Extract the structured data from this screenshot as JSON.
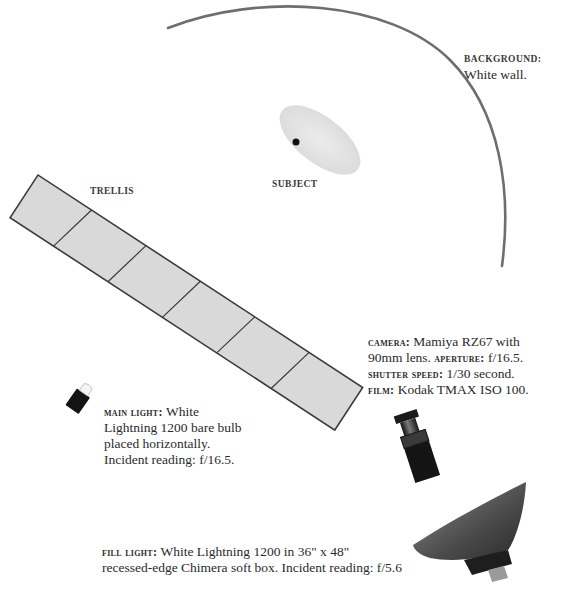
{
  "diagram": {
    "type": "lighting-diagram",
    "colors": {
      "background": "#ffffff",
      "wall_arc": "#6e6e6e",
      "trellis_fill": "#d9d9d9",
      "trellis_stroke": "#3a3a3a",
      "subject_fill": "#e6e6e6",
      "equipment_dark": "#1a1a1a",
      "softbox": "#5a5a5a",
      "text": "#2b2b2b"
    }
  },
  "labels": {
    "trellis": "TRELLIS",
    "subject": "SUBJECT",
    "background": {
      "title": "BACKGROUND:",
      "text": "White wall."
    },
    "camera": {
      "camera_label": "CAMERA:",
      "camera_value": "Mamiya RZ67 with",
      "camera_value2": "90mm lens.",
      "aperture_label": "APERTURE:",
      "aperture_value": "f/16.5.",
      "shutter_label": "SHUTTER SPEED:",
      "shutter_value": "1/30 second.",
      "film_label": "FILM:",
      "film_value": "Kodak TMAX ISO 100."
    },
    "main_light": {
      "title": "MAIN LIGHT:",
      "line1": "White",
      "line2": "Lightning 1200 bare bulb",
      "line3": "placed horizontally.",
      "line4": "Incident reading: f/16.5."
    },
    "fill_light": {
      "title": "FILL LIGHT:",
      "line1": "White Lightning 1200 in 36\" x 48\"",
      "line2": "recessed-edge Chimera soft box. Incident reading: f/5.6"
    }
  }
}
